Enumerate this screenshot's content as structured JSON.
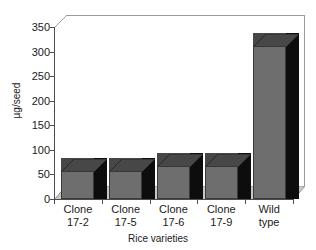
{
  "chart_data": {
    "type": "bar",
    "title": "",
    "subtitle": "",
    "xlabel": "Rice varieties",
    "ylabel": "µg/seed",
    "categories": [
      "Clone 17-2",
      "Clone 17-5",
      "Clone 17-6",
      "Clone 17-9",
      "Wild type"
    ],
    "category_lines": [
      [
        "Clone",
        "17-2"
      ],
      [
        "Clone",
        "17-5"
      ],
      [
        "Clone",
        "17-6"
      ],
      [
        "Clone",
        "17-9"
      ],
      [
        "Wild",
        "type"
      ]
    ],
    "values": [
      58,
      56,
      67,
      68,
      312
    ],
    "ylim": [
      0,
      350
    ],
    "ytick_values": [
      0,
      50,
      100,
      150,
      200,
      250,
      300,
      350
    ],
    "ytick_labels": [
      "0",
      "50",
      "100",
      "150",
      "200",
      "250",
      "300",
      "350"
    ],
    "grid": false,
    "legend": null,
    "legend_position": "none",
    "style": "3d-bar",
    "colors": {
      "bar_front": "#6e6e6e",
      "bar_side": "#0d0d0d",
      "bar_top": "#474747",
      "floor": "#c9c9c9",
      "floor_edge": "#8f8f8f",
      "axis": "#4d4d4d",
      "wall_outline": "#9a9a9a",
      "background": "#ffffff",
      "text": "#1a1a1a"
    }
  }
}
